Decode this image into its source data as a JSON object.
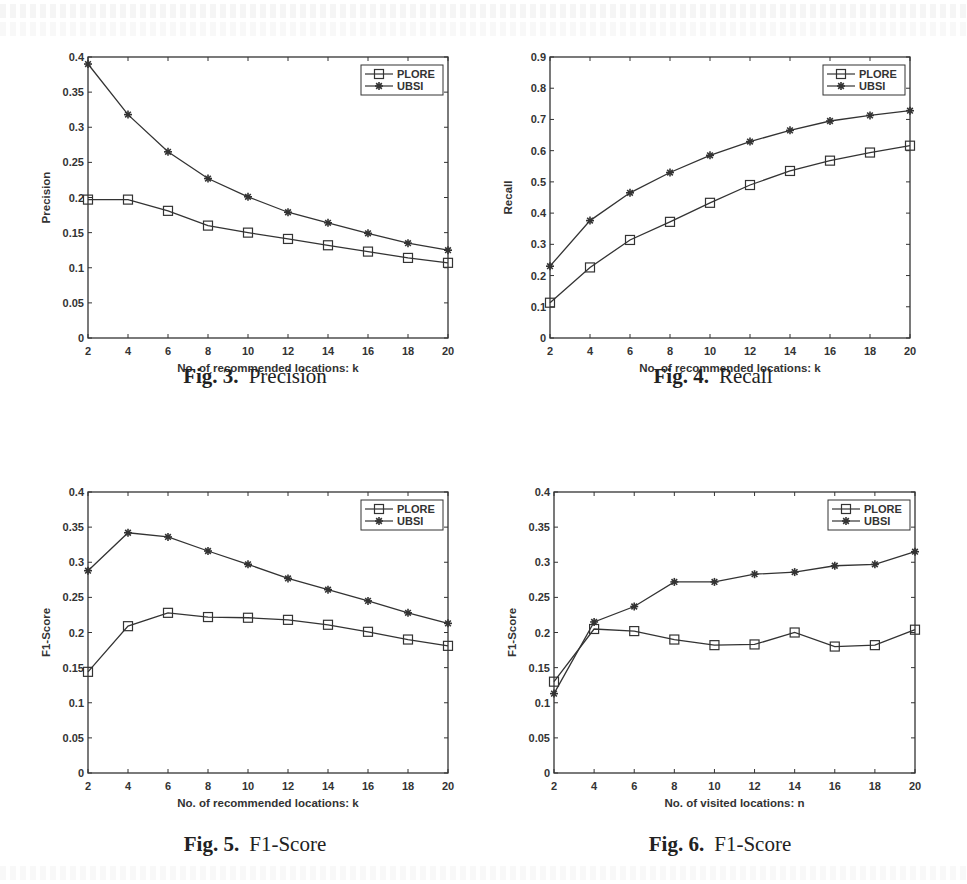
{
  "figures": [
    {
      "number": "Fig. 3.",
      "title": "Precision"
    },
    {
      "number": "Fig. 4.",
      "title": "Recall"
    },
    {
      "number": "Fig. 5.",
      "title": "F1-Score"
    },
    {
      "number": "Fig. 6.",
      "title": "F1-Score"
    }
  ],
  "colors": {
    "line": "#333333",
    "axis": "#333333",
    "background": "#ffffff"
  },
  "chart_data": [
    {
      "type": "line",
      "title": "Fig. 3. Precision",
      "xlabel": "No. of recommended locations: k",
      "ylabel": "Precision",
      "x": [
        2,
        4,
        6,
        8,
        10,
        12,
        14,
        16,
        18,
        20
      ],
      "xticks": [
        2,
        4,
        6,
        8,
        10,
        12,
        14,
        16,
        18,
        20
      ],
      "yticks": [
        0,
        0.05,
        0.1,
        0.15,
        0.2,
        0.25,
        0.3,
        0.35,
        0.4
      ],
      "ylim": [
        0,
        0.4
      ],
      "xlim": [
        2,
        20
      ],
      "grid": false,
      "legend_position": "upper right",
      "series": [
        {
          "name": "PLORE",
          "marker": "square",
          "values": [
            0.197,
            0.197,
            0.181,
            0.16,
            0.15,
            0.141,
            0.132,
            0.123,
            0.114,
            0.107
          ]
        },
        {
          "name": "UBSI",
          "marker": "star",
          "values": [
            0.39,
            0.318,
            0.265,
            0.227,
            0.201,
            0.179,
            0.164,
            0.149,
            0.135,
            0.125
          ]
        }
      ]
    },
    {
      "type": "line",
      "title": "Fig. 4. Recall",
      "xlabel": "No. of recommended locations: k",
      "ylabel": "Recall",
      "x": [
        2,
        4,
        6,
        8,
        10,
        12,
        14,
        16,
        18,
        20
      ],
      "xticks": [
        2,
        4,
        6,
        8,
        10,
        12,
        14,
        16,
        18,
        20
      ],
      "yticks": [
        0,
        0.1,
        0.2,
        0.3,
        0.4,
        0.5,
        0.6,
        0.7,
        0.8,
        0.9
      ],
      "ylim": [
        0,
        0.9
      ],
      "xlim": [
        2,
        20
      ],
      "grid": false,
      "legend_position": "upper right",
      "series": [
        {
          "name": "PLORE",
          "marker": "square",
          "values": [
            0.113,
            0.226,
            0.314,
            0.372,
            0.433,
            0.49,
            0.535,
            0.568,
            0.594,
            0.616
          ]
        },
        {
          "name": "UBSI",
          "marker": "star",
          "values": [
            0.23,
            0.376,
            0.465,
            0.53,
            0.585,
            0.629,
            0.665,
            0.695,
            0.713,
            0.728
          ]
        }
      ]
    },
    {
      "type": "line",
      "title": "Fig. 5. F1-Score",
      "xlabel": "No. of recommended locations: k",
      "ylabel": "F1-Score",
      "x": [
        2,
        4,
        6,
        8,
        10,
        12,
        14,
        16,
        18,
        20
      ],
      "xticks": [
        2,
        4,
        6,
        8,
        10,
        12,
        14,
        16,
        18,
        20
      ],
      "yticks": [
        0,
        0.05,
        0.1,
        0.15,
        0.2,
        0.25,
        0.3,
        0.35,
        0.4
      ],
      "ylim": [
        0,
        0.4
      ],
      "xlim": [
        2,
        20
      ],
      "grid": false,
      "legend_position": "upper right",
      "series": [
        {
          "name": "PLORE",
          "marker": "square",
          "values": [
            0.144,
            0.209,
            0.228,
            0.222,
            0.221,
            0.218,
            0.211,
            0.201,
            0.19,
            0.181
          ]
        },
        {
          "name": "UBSI",
          "marker": "star",
          "values": [
            0.288,
            0.342,
            0.336,
            0.316,
            0.297,
            0.277,
            0.261,
            0.245,
            0.228,
            0.213
          ]
        }
      ]
    },
    {
      "type": "line",
      "title": "Fig. 6. F1-Score",
      "xlabel": "No. of visited locations: n",
      "ylabel": "F1-Score",
      "x": [
        2,
        4,
        6,
        8,
        10,
        12,
        14,
        16,
        18,
        20
      ],
      "xticks": [
        2,
        4,
        6,
        8,
        10,
        12,
        14,
        16,
        18,
        20
      ],
      "yticks": [
        0,
        0.05,
        0.1,
        0.15,
        0.2,
        0.25,
        0.3,
        0.35,
        0.4
      ],
      "ylim": [
        0,
        0.4
      ],
      "xlim": [
        2,
        20
      ],
      "grid": false,
      "legend_position": "upper right",
      "series": [
        {
          "name": "PLORE",
          "marker": "square",
          "values": [
            0.13,
            0.205,
            0.202,
            0.19,
            0.182,
            0.183,
            0.2,
            0.18,
            0.182,
            0.204
          ]
        },
        {
          "name": "UBSI",
          "marker": "star",
          "values": [
            0.113,
            0.215,
            0.237,
            0.272,
            0.272,
            0.283,
            0.286,
            0.295,
            0.297,
            0.315
          ]
        }
      ]
    }
  ]
}
